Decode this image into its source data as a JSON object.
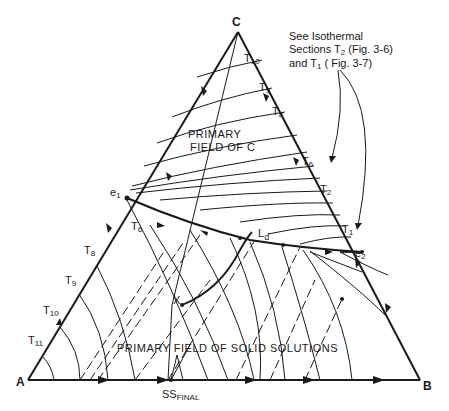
{
  "diagram": {
    "type": "ternary-phase-diagram",
    "vertices": {
      "A": "A",
      "B": "B",
      "C": "C"
    },
    "eutectics": {
      "e1": "e",
      "e1_sub": "1",
      "e2": "e",
      "e2_sub": "2"
    },
    "fields": {
      "primary_c_line1": "PRIMARY",
      "primary_c_line2": "FIELD OF C",
      "primary_ss": "PRIMARY FIELD OF SOLID SOLUTIONS"
    },
    "points": {
      "x": "X",
      "ld": "L",
      "ld_sub": "d",
      "ss_final": "SS",
      "ss_final_sub": "FINAL"
    },
    "note": {
      "line1": "See Isothermal",
      "line2_a": "Sections T",
      "line2_sub": "2",
      "line2_b": " (Fig. 3-6)",
      "line3_a": "and T",
      "line3_sub": "1",
      "line3_b": " ( Fig. 3-7)"
    },
    "isotherms_bc_edge": [
      {
        "t": "T",
        "sub": "10"
      },
      {
        "t": "T",
        "sub": "9"
      },
      {
        "t": "T",
        "sub": "8"
      },
      {
        "t": "T",
        "sub": "6"
      },
      {
        "t": "T",
        "sub": "2"
      },
      {
        "t": "T",
        "sub": "1"
      }
    ],
    "isotherms_ac_edge": [
      {
        "t": "T",
        "sub": "8"
      },
      {
        "t": "T",
        "sub": "9"
      },
      {
        "t": "T",
        "sub": "10"
      },
      {
        "t": "T",
        "sub": "11"
      }
    ],
    "interior_labels": [
      {
        "t": "T",
        "sub": "6"
      }
    ]
  }
}
